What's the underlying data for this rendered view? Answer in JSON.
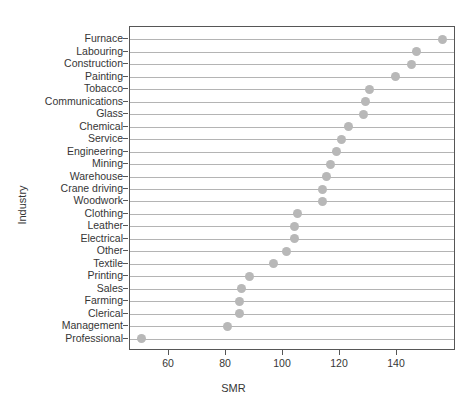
{
  "chart_data": {
    "type": "scatter",
    "title": "",
    "xlabel": "SMR",
    "ylabel": "Industry",
    "xlim": [
      46,
      160
    ],
    "xticks": [
      60,
      80,
      100,
      120,
      140
    ],
    "xticklabels": [
      "60",
      "80",
      "100",
      "120",
      "140"
    ],
    "grid": true,
    "grid_orientation": "horizontal",
    "legend": "none",
    "marker_color": "#b8b8b8",
    "grid_color": "#b4b4b4",
    "axis_color": "#565656",
    "text_color": "#363636",
    "categories": [
      "Furnace",
      "Labouring",
      "Construction",
      "Painting",
      "Tobacco",
      "Communications",
      "Glass",
      "Chemical",
      "Service",
      "Engineering",
      "Mining",
      "Warehouse",
      "Crane driving",
      "Woodwork",
      "Clothing",
      "Leather",
      "Electrical",
      "Other",
      "Textile",
      "Printing",
      "Sales",
      "Farming",
      "Clerical",
      "Management",
      "Professional"
    ],
    "values": [
      155.8,
      147.0,
      145.0,
      139.6,
      130.2,
      128.8,
      128.4,
      123.0,
      120.7,
      118.6,
      116.8,
      115.4,
      113.7,
      113.7,
      105.0,
      104.2,
      103.9,
      101.4,
      96.5,
      88.1,
      85.6,
      84.9,
      84.6,
      80.4,
      59.3
    ],
    "professional_value": 50.5
  }
}
